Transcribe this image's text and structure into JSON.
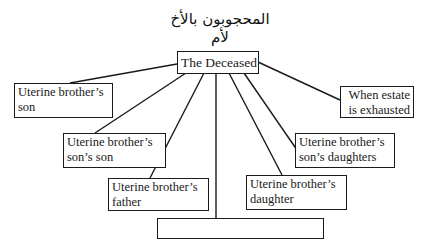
{
  "diagram": {
    "title": "المحجوبون بالأخ لأم",
    "root": "The Deceased",
    "nodes": [
      {
        "id": "son",
        "line1": "Uterine brother’s",
        "line2": "son"
      },
      {
        "id": "sons-son",
        "line1": "Uterine brother’s",
        "line2": "son’s son"
      },
      {
        "id": "father",
        "line1": "Uterine brother’s",
        "line2": "father"
      },
      {
        "id": "grandfather",
        "line1": "Uterine brother’s   grandfather"
      },
      {
        "id": "daughter",
        "line1": "Uterine brother’s",
        "line2": "daughter"
      },
      {
        "id": "sons-daughters",
        "line1": "Uterine brother’s",
        "line2": "son’s daughters"
      },
      {
        "id": "estate",
        "line1": "When estate",
        "line2": "is exhausted"
      }
    ]
  }
}
